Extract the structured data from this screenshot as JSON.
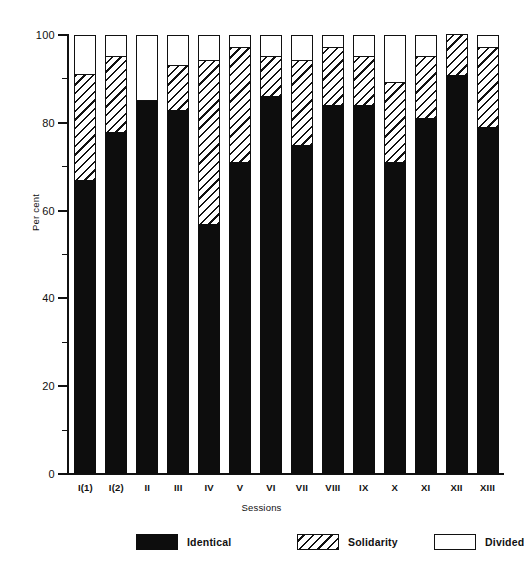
{
  "chart_data": {
    "type": "bar",
    "stacked": true,
    "title": "",
    "xlabel": "Sessions",
    "ylabel": "Per cent",
    "ylim": [
      0,
      100
    ],
    "yticks": [
      0,
      20,
      40,
      60,
      80,
      100
    ],
    "ytick_labels": [
      "0",
      "20",
      "40",
      "60",
      "80",
      "100"
    ],
    "yminor_ticks": [
      10,
      30,
      50,
      70,
      90
    ],
    "grid": false,
    "legend_position": "bottom",
    "categories": [
      "I(1)",
      "I(2)",
      "II",
      "III",
      "IV",
      "V",
      "VI",
      "VII",
      "VIII",
      "IX",
      "X",
      "XI",
      "XII",
      "XIII"
    ],
    "series": [
      {
        "name": "Identical",
        "color": "#0d0d0d",
        "pattern": "solid",
        "values": [
          67,
          78,
          85,
          83,
          57,
          71,
          86,
          75,
          84,
          84,
          71,
          81,
          91,
          79
        ]
      },
      {
        "name": "Solidarity",
        "color": "#ffffff",
        "pattern": "diagonal-hatch",
        "values": [
          24,
          17,
          0,
          10,
          37,
          26,
          9,
          19,
          13,
          11,
          18,
          14,
          9,
          18
        ]
      },
      {
        "name": "Divided",
        "color": "#ffffff",
        "pattern": "empty",
        "values": [
          9,
          5,
          15,
          7,
          6,
          3,
          5,
          6,
          3,
          5,
          11,
          5,
          0,
          3
        ]
      }
    ]
  },
  "legend": {
    "items": [
      {
        "label": "Identical",
        "swatch": "black-filled-swatch"
      },
      {
        "label": "Solidarity",
        "swatch": "hatched-swatch"
      },
      {
        "label": "Divided",
        "swatch": "empty-swatch"
      }
    ]
  }
}
